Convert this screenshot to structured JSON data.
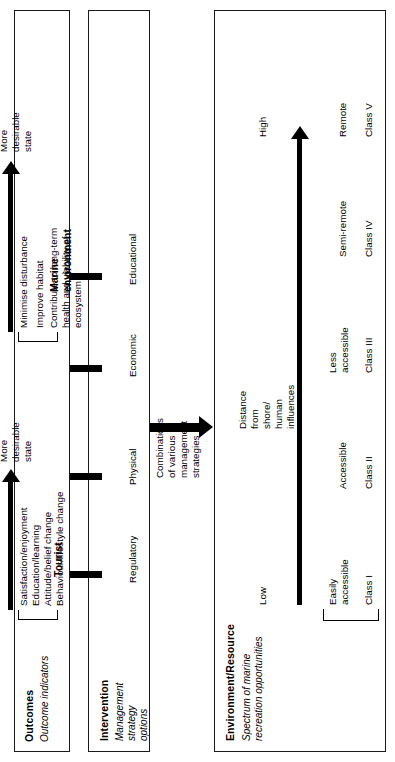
{
  "figure": {
    "orientation": "rotated-90-ccw",
    "line_color": "#000000",
    "background": "#ffffff"
  },
  "environment_box": {
    "title": "Environment/Resource",
    "subtitle": "Spectrum of marine\nrecreation opportunities",
    "gradient_axis": {
      "start_label": "Low",
      "end_label": "High",
      "axis_caption": "Distance\nfrom\nshore/\nhuman\ninfluences"
    },
    "classes": [
      {
        "class": "Class I",
        "access": "Easily\naccessible"
      },
      {
        "class": "Class II",
        "access": "Accessible"
      },
      {
        "class": "Class III",
        "access": "Less\naccessible"
      },
      {
        "class": "Class IV",
        "access": "Semi-remote"
      },
      {
        "class": "Class V",
        "access": "Remote"
      }
    ]
  },
  "connector": {
    "caption": "Combinations\nof various\nmanagement\nstrategies",
    "arrow": "down-arrow"
  },
  "intervention_box": {
    "title": "Intervention",
    "subtitle": "Management\nstrategy\noptions",
    "options": [
      "Regulatory",
      "Physical",
      "Economic",
      "Educational"
    ]
  },
  "outcomes_box": {
    "title": "Outcomes",
    "subtitle": "Outcome indicators",
    "groups": [
      {
        "name": "Tourist",
        "direction_label": "More\ndesirable\nstate",
        "indicators": [
          "Satisfaction/enjoyment",
          "Education/learning",
          "Attitude/belief change",
          "Behaviour/lifestyle change"
        ]
      },
      {
        "name": "Marine\nenvironment",
        "direction_label": "More\ndesirable\nstate",
        "indicators": [
          "Minimise disturbance",
          "Improve habitat",
          "Contribute to long-term\nhealth and viability of\necosystem"
        ]
      }
    ]
  }
}
